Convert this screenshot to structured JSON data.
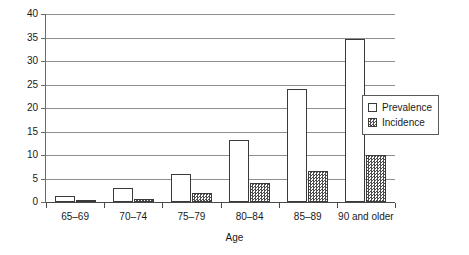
{
  "chart_data": {
    "type": "bar",
    "title": "",
    "subtitle": "",
    "xlabel": "Age",
    "ylabel": "",
    "ylim": [
      0,
      40
    ],
    "yticks": [
      0,
      5,
      10,
      15,
      20,
      25,
      30,
      35,
      40
    ],
    "ytick_labels": [
      "0",
      "5",
      "10",
      "15",
      "20",
      "25",
      "30",
      "35",
      "40"
    ],
    "grid": true,
    "legend_position": "upper right inside plot",
    "categories": [
      "65–69",
      "70–74",
      "75–79",
      "80–84",
      "85–89",
      "90 and older"
    ],
    "series": [
      {
        "name": "Prevalence",
        "values": [
          1.2,
          2.9,
          6.0,
          13.3,
          24.0,
          34.6
        ],
        "fill": "open",
        "color": "#ffffff",
        "edge_color": "#3a3a3a"
      },
      {
        "name": "Incidence",
        "values": [
          0.4,
          0.7,
          1.9,
          4.1,
          6.5,
          10.0
        ],
        "fill": "checker-hatch",
        "color": "#4d4d4d",
        "edge_color": "#3a3a3a"
      }
    ],
    "annotations": []
  },
  "legend": {
    "items": [
      {
        "label": "Prevalence",
        "swatch": "open-square-swatch"
      },
      {
        "label": "Incidence",
        "swatch": "hatched-square-swatch"
      }
    ]
  },
  "axes": {
    "x_title": "Age",
    "y_tick_labels": [
      "0",
      "5",
      "10",
      "15",
      "20",
      "25",
      "30",
      "35",
      "40"
    ],
    "x_tick_labels": [
      "65–69",
      "70–74",
      "75–79",
      "80–84",
      "85–89",
      "90 and older"
    ]
  },
  "colors": {
    "gridline": "#8f8f8f",
    "axis": "#4a4a4a",
    "bar_edge": "#3a3a3a",
    "text": "#1a1a1a",
    "background": "#ffffff"
  }
}
